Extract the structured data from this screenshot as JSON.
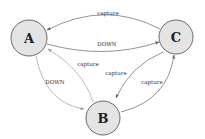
{
  "diagram": {
    "nodes": [
      {
        "id": "A",
        "label": "A"
      },
      {
        "id": "B",
        "label": "B"
      },
      {
        "id": "C",
        "label": "C"
      }
    ],
    "edges": [
      {
        "from": "C",
        "to": "A",
        "label": "capture"
      },
      {
        "from": "A",
        "to": "C",
        "label": "DOWN"
      },
      {
        "from": "A",
        "to": "B",
        "label": "DOWN"
      },
      {
        "from": "B",
        "to": "A",
        "label": "capture"
      },
      {
        "from": "C",
        "to": "B",
        "label": "capture"
      },
      {
        "from": "B",
        "to": "C",
        "label": "capture"
      }
    ],
    "colors": {
      "node_fill": "#e4e4e4",
      "node_stroke": "#6a6a6a",
      "edge": "#777777"
    }
  }
}
